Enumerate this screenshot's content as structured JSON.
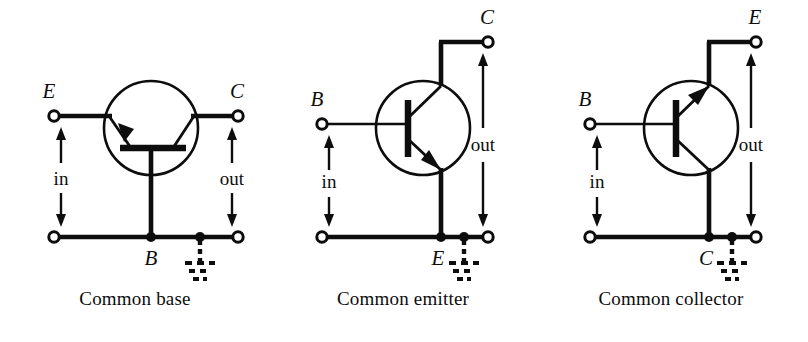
{
  "figure": {
    "background_color": "#ffffff",
    "ink_color": "#0d0d0d",
    "panel_count": 3
  },
  "panels": [
    {
      "id": "common-base",
      "caption": "Common base",
      "transistor_type": "npn",
      "orientation": "base-down",
      "terminals": {
        "top_left_label": "E",
        "top_right_label": "C",
        "common_label": "B"
      },
      "signals": {
        "input_label": "in",
        "output_label": "out"
      },
      "ground": "earth-ground",
      "input_terminal": "E",
      "output_terminal": "C",
      "common_terminal": "B"
    },
    {
      "id": "common-emitter",
      "caption": "Common emitter",
      "transistor_type": "npn",
      "orientation": "base-left-emitter-down",
      "terminals": {
        "top_left_label": "B",
        "top_right_label": "C",
        "common_label": "E"
      },
      "signals": {
        "input_label": "in",
        "output_label": "out"
      },
      "ground": "earth-ground",
      "input_terminal": "B",
      "output_terminal": "C",
      "common_terminal": "E"
    },
    {
      "id": "common-collector",
      "caption": "Common collector",
      "transistor_type": "npn",
      "orientation": "base-left-emitter-up",
      "terminals": {
        "top_left_label": "B",
        "top_right_label": "E",
        "common_label": "C"
      },
      "signals": {
        "input_label": "in",
        "output_label": "out"
      },
      "ground": "earth-ground",
      "input_terminal": "B",
      "output_terminal": "E",
      "common_terminal": "C"
    }
  ]
}
